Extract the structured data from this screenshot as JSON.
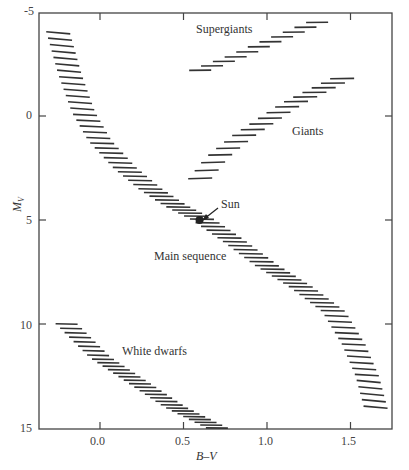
{
  "chart_data": {
    "type": "scatter",
    "title": "",
    "xlabel": "B–V",
    "ylabel": "M_V",
    "xlim": [
      -0.37,
      1.75
    ],
    "ylim": [
      15,
      -5
    ],
    "grid": false,
    "x_ticks": [
      "0.0",
      "0.5",
      "1.0",
      "1.5"
    ],
    "y_ticks": [
      "-5",
      "0",
      "5",
      "10",
      "15"
    ],
    "annotations": [
      {
        "text": "Supergiants",
        "x": 0.55,
        "y": -4.5
      },
      {
        "text": "Giants",
        "x": 1.04,
        "y": 0.6
      },
      {
        "text": "Sun",
        "x": 0.7,
        "y": 4.2
      },
      {
        "text": "Main sequence",
        "x": 0.45,
        "y": 7.0
      },
      {
        "text": "White dwarfs",
        "x": 0.12,
        "y": 11.2
      }
    ],
    "series": [
      {
        "name": "Main sequence",
        "points": [
          [
            -0.25,
            -4.0
          ],
          [
            -0.18,
            -2.0
          ],
          [
            -0.1,
            -0.2
          ],
          [
            0.0,
            1.2
          ],
          [
            0.15,
            2.5
          ],
          [
            0.3,
            3.5
          ],
          [
            0.45,
            4.3
          ],
          [
            0.62,
            5.0
          ],
          [
            0.8,
            6.0
          ],
          [
            1.0,
            7.2
          ],
          [
            1.2,
            8.2
          ],
          [
            1.4,
            9.4
          ],
          [
            1.52,
            11.0
          ],
          [
            1.6,
            12.5
          ],
          [
            1.65,
            14.0
          ]
        ]
      },
      {
        "name": "Giants",
        "points": [
          [
            0.6,
            3.0
          ],
          [
            0.7,
            2.0
          ],
          [
            0.85,
            1.0
          ],
          [
            1.0,
            0.2
          ],
          [
            1.15,
            -0.6
          ],
          [
            1.3,
            -1.2
          ],
          [
            1.45,
            -1.8
          ]
        ]
      },
      {
        "name": "Supergiants",
        "points": [
          [
            0.6,
            -2.2
          ],
          [
            0.8,
            -2.8
          ],
          [
            1.0,
            -3.5
          ],
          [
            1.15,
            -4.0
          ],
          [
            1.3,
            -4.5
          ]
        ]
      },
      {
        "name": "White dwarfs",
        "points": [
          [
            -0.2,
            10.0
          ],
          [
            -0.1,
            10.8
          ],
          [
            0.0,
            11.6
          ],
          [
            0.15,
            12.4
          ],
          [
            0.3,
            13.2
          ],
          [
            0.45,
            14.0
          ],
          [
            0.6,
            14.6
          ],
          [
            0.7,
            15.0
          ]
        ]
      },
      {
        "name": "Sun",
        "points": [
          [
            0.62,
            5.0
          ]
        ]
      }
    ]
  },
  "labels": {
    "supergiants": "Supergiants",
    "giants": "Giants",
    "sun": "Sun",
    "main_sequence": "Main sequence",
    "white_dwarfs": "White dwarfs",
    "xlabel": "B–V",
    "ylabel": "M",
    "ylabel_sub": "V"
  }
}
